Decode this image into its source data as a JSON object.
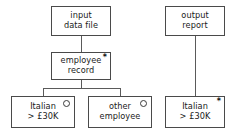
{
  "diagram": {
    "type": "jsp-structure-diagram",
    "canvas": {
      "width": 238,
      "height": 134
    },
    "colors": {
      "background": "#ffffff",
      "box_border": "#4a4a4a",
      "connector": "#5a5a5a",
      "text": "#1a1a1a",
      "marker": "#111111"
    },
    "marker_legend": {
      "iteration": "*",
      "selection": "○"
    }
  },
  "trees": [
    {
      "name": "input-structure",
      "nodes": [
        {
          "id": "input-data-file",
          "line1": "input",
          "line2": "data file",
          "marker": "none",
          "box": {
            "x": 51,
            "y": 6,
            "w": 60,
            "h": 30
          }
        },
        {
          "id": "employee-record",
          "line1": "employee",
          "line2": "record",
          "marker": "iteration",
          "marker_glyph": "*",
          "box": {
            "x": 51,
            "y": 52,
            "w": 60,
            "h": 28
          }
        },
        {
          "id": "italian-over-30k-input",
          "line1": "Italian",
          "line2": "> £30K",
          "marker": "selection",
          "marker_glyph": "○",
          "box": {
            "x": 11,
            "y": 96,
            "w": 64,
            "h": 32
          }
        },
        {
          "id": "other-employee",
          "line1": "other",
          "line2": "employee",
          "marker": "selection",
          "marker_glyph": "○",
          "box": {
            "x": 88,
            "y": 96,
            "w": 64,
            "h": 32
          }
        }
      ]
    },
    {
      "name": "output-structure",
      "nodes": [
        {
          "id": "output-report",
          "line1": "output",
          "line2": "report",
          "marker": "none",
          "box": {
            "x": 165,
            "y": 6,
            "w": 60,
            "h": 30
          }
        },
        {
          "id": "italian-over-30k-output",
          "line1": "Italian",
          "line2": "> £30K",
          "marker": "iteration",
          "marker_glyph": "*",
          "box": {
            "x": 165,
            "y": 96,
            "w": 60,
            "h": 32
          }
        }
      ]
    }
  ],
  "connectors": [
    {
      "id": "input-to-employee",
      "orient": "v",
      "x": 81,
      "y": 36,
      "len": 16
    },
    {
      "id": "employee-stem-down",
      "orient": "v",
      "x": 81,
      "y": 80,
      "len": 8
    },
    {
      "id": "employee-children-bar",
      "orient": "h",
      "x": 43,
      "y": 88,
      "len": 78
    },
    {
      "id": "bar-to-italian-input",
      "orient": "v",
      "x": 43,
      "y": 88,
      "len": 8
    },
    {
      "id": "bar-to-other-employee",
      "orient": "v",
      "x": 120,
      "y": 88,
      "len": 8
    },
    {
      "id": "report-to-italian-output",
      "orient": "v",
      "x": 195,
      "y": 36,
      "len": 60
    }
  ]
}
